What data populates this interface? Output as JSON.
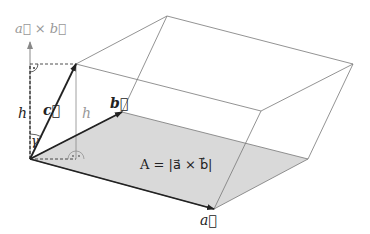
{
  "diagram": {
    "type": "parallelepiped",
    "labels": {
      "cross_axis": "a⃗ × b⃗",
      "h_left": "h",
      "h_inner": "h",
      "gamma": "γ",
      "vec_a": "a⃗",
      "vec_b": "b⃗",
      "vec_c": "c⃗",
      "area": "A = |a⃗ × b⃗|"
    },
    "colors": {
      "base_fill": "#d9d9d9",
      "edge": "#777777",
      "vector": "#222222",
      "axis": "#888888",
      "label_gray": "#999999"
    }
  }
}
